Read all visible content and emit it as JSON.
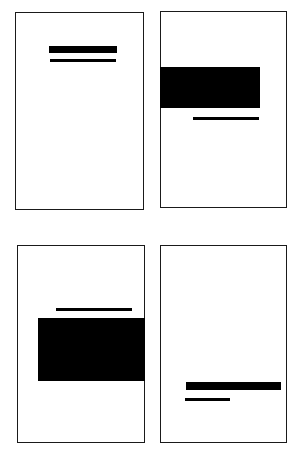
{
  "diagram": {
    "colors": {
      "ink": "#000000",
      "page": "#ffffff",
      "border": "#1a1a1a"
    },
    "panels": [
      {
        "id": "top-left",
        "box": [
          15,
          12,
          129,
          198
        ],
        "shapes": [
          {
            "type": "thick-bar",
            "box": [
              49,
              46,
              68,
              7
            ]
          },
          {
            "type": "thin-rule",
            "box": [
              50,
              59,
              66,
              2.5
            ]
          }
        ]
      },
      {
        "id": "top-right",
        "box": [
          160,
          11,
          127,
          197
        ],
        "shapes": [
          {
            "type": "block",
            "box": [
              160,
              67,
              100,
              41
            ]
          },
          {
            "type": "thin-rule",
            "box": [
              193,
              117,
              66,
              2.5
            ]
          }
        ]
      },
      {
        "id": "bottom-left",
        "box": [
          17,
          245,
          128,
          198
        ],
        "shapes": [
          {
            "type": "thin-rule",
            "box": [
              56,
              308,
              76,
              2.5
            ]
          },
          {
            "type": "block",
            "box": [
              38,
              318,
              107,
              63
            ]
          }
        ]
      },
      {
        "id": "bottom-right",
        "box": [
          160,
          245,
          127,
          198
        ],
        "shapes": [
          {
            "type": "thick-bar",
            "box": [
              186,
              382,
              95,
              8
            ]
          },
          {
            "type": "thin-rule",
            "box": [
              185,
              398,
              45,
              2.5
            ]
          }
        ]
      }
    ]
  }
}
